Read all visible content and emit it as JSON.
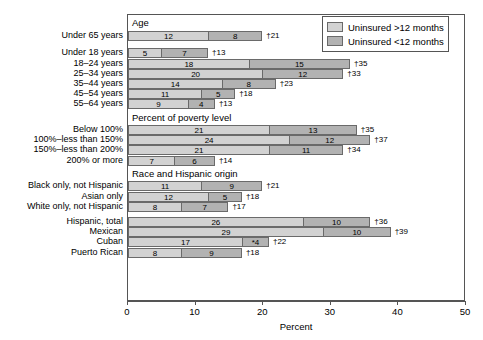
{
  "chart_data": {
    "type": "bar",
    "orientation": "horizontal",
    "stacked": true,
    "title": "",
    "xlabel": "Percent",
    "ylabel": "",
    "xlim": [
      0,
      50
    ],
    "xticks": [
      0,
      10,
      20,
      30,
      40,
      50
    ],
    "grid": false,
    "legend_position": "top-right",
    "series": [
      {
        "name": "Uninsured >12 months",
        "color": "#d2d2d2"
      },
      {
        "name": "Uninsured <12 months",
        "color": "#b2b2b2"
      }
    ],
    "sections": [
      {
        "header": "Age",
        "rows": [
          {
            "label": "Under 65 years",
            "gt12": 12,
            "lt12": 8,
            "total": "†21",
            "gt12_label": "12",
            "lt12_label": "8"
          },
          {
            "label": "",
            "spacer": true
          },
          {
            "label": "Under 18 years",
            "gt12": 5,
            "lt12": 7,
            "total": "†13",
            "gt12_label": "5",
            "lt12_label": "7"
          },
          {
            "label": "18–24 years",
            "gt12": 18,
            "lt12": 15,
            "total": "†35",
            "gt12_label": "18",
            "lt12_label": "15"
          },
          {
            "label": "25–34 years",
            "gt12": 20,
            "lt12": 12,
            "total": "†33",
            "gt12_label": "20",
            "lt12_label": "12"
          },
          {
            "label": "35–44 years",
            "gt12": 14,
            "lt12": 8,
            "total": "†23",
            "gt12_label": "14",
            "lt12_label": "8"
          },
          {
            "label": "45–54 years",
            "gt12": 11,
            "lt12": 5,
            "total": "†18",
            "gt12_label": "11",
            "lt12_label": "5"
          },
          {
            "label": "55–64 years",
            "gt12": 9,
            "lt12": 4,
            "total": "†13",
            "gt12_label": "9",
            "lt12_label": "4"
          }
        ]
      },
      {
        "header": "Percent of poverty level",
        "rows": [
          {
            "label": "Below 100%",
            "gt12": 21,
            "lt12": 13,
            "total": "†35",
            "gt12_label": "21",
            "lt12_label": "13"
          },
          {
            "label": "100%–less than 150%",
            "gt12": 24,
            "lt12": 12,
            "total": "†37",
            "gt12_label": "24",
            "lt12_label": "12"
          },
          {
            "label": "150%–less than 200%",
            "gt12": 21,
            "lt12": 11,
            "total": "†34",
            "gt12_label": "21",
            "lt12_label": "11"
          },
          {
            "label": "200% or more",
            "gt12": 7,
            "lt12": 6,
            "total": "†14",
            "gt12_label": "7",
            "lt12_label": "6"
          }
        ]
      },
      {
        "header": "Race and Hispanic origin",
        "rows": [
          {
            "label": "Black only, not Hispanic",
            "gt12": 11,
            "lt12": 9,
            "total": "†21",
            "gt12_label": "11",
            "lt12_label": "9"
          },
          {
            "label": "Asian only",
            "gt12": 12,
            "lt12": 5,
            "total": "†18",
            "gt12_label": "12",
            "lt12_label": "5"
          },
          {
            "label": "White only, not Hispanic",
            "gt12": 8,
            "lt12": 7,
            "total": "†17",
            "gt12_label": "8",
            "lt12_label": "7"
          }
        ]
      },
      {
        "header": "",
        "rows": [
          {
            "label": "Hispanic, total",
            "gt12": 26,
            "lt12": 10,
            "total": "†36",
            "gt12_label": "26",
            "lt12_label": "10"
          },
          {
            "label": "Mexican",
            "gt12": 29,
            "lt12": 10,
            "total": "†39",
            "gt12_label": "29",
            "lt12_label": "10"
          },
          {
            "label": "Cuban",
            "gt12": 17,
            "lt12": 4,
            "total": "†22",
            "gt12_label": "17",
            "lt12_label": "*4"
          },
          {
            "label": "Puerto Rican",
            "gt12": 8,
            "lt12": 9,
            "total": "†18",
            "gt12_label": "8",
            "lt12_label": "9"
          }
        ]
      }
    ]
  },
  "legend": {
    "items": [
      {
        "label": "Uninsured >12 months",
        "swatch": "light"
      },
      {
        "label": "Uninsured <12 months",
        "swatch": "dark"
      }
    ]
  },
  "axis": {
    "title": "Percent",
    "ticks": [
      "0",
      "10",
      "20",
      "30",
      "40",
      "50"
    ]
  },
  "colors": {
    "gt12": "#d2d2d2",
    "lt12": "#b2b2b2",
    "frame": "#555555",
    "segment_border": "#6a6a6a"
  }
}
